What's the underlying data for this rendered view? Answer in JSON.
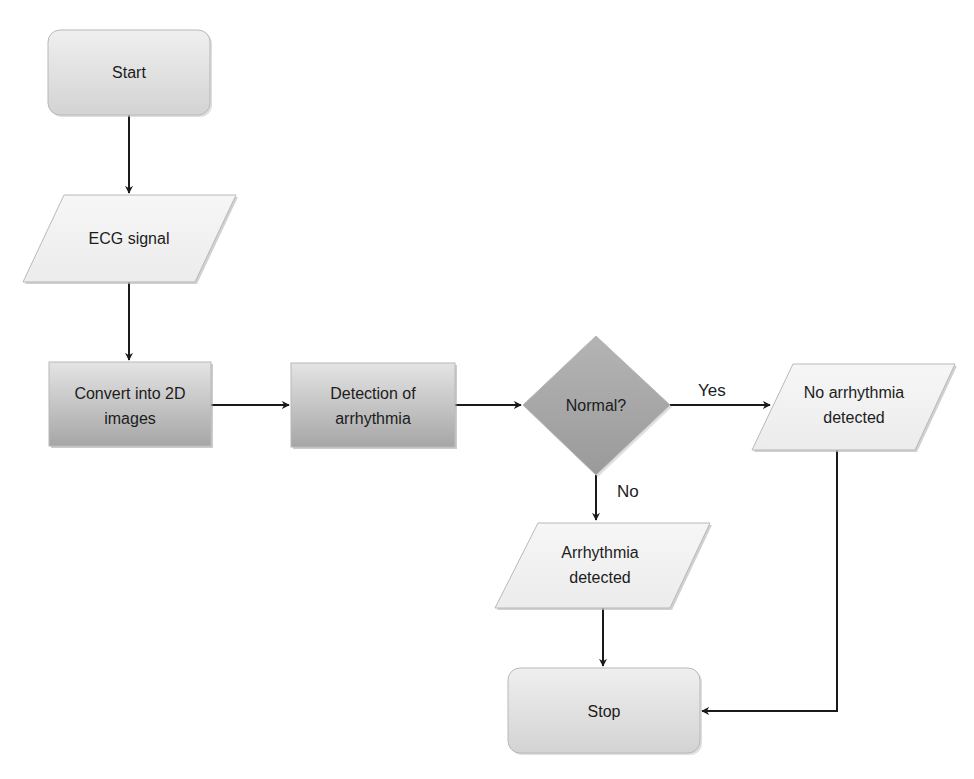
{
  "diagram": {
    "type": "flowchart",
    "colors": {
      "terminal_fill_top": "#eeeeee",
      "terminal_fill_bottom": "#d6d6d6",
      "io_fill": "#f2f2f2",
      "process_fill_top": "#e2e2e2",
      "process_fill_bottom": "#a9a9a9",
      "decision_fill": "#a8a8a8",
      "edge": "#1a1a1a",
      "text": "#1c1c1c"
    },
    "nodes": {
      "start": {
        "shape": "terminal",
        "lines": [
          "Start"
        ]
      },
      "ecg": {
        "shape": "input-output",
        "lines": [
          "ECG signal"
        ]
      },
      "convert": {
        "shape": "process",
        "lines": [
          "Convert into 2D",
          "images"
        ]
      },
      "detection": {
        "shape": "process",
        "lines": [
          "Detection of",
          "arrhythmia"
        ]
      },
      "decision": {
        "shape": "decision",
        "lines": [
          "Normal?"
        ]
      },
      "no_arr": {
        "shape": "input-output",
        "lines": [
          "No arrhythmia",
          "detected"
        ]
      },
      "arr": {
        "shape": "input-output",
        "lines": [
          "Arrhythmia",
          "detected"
        ]
      },
      "stop": {
        "shape": "terminal",
        "lines": [
          "Stop"
        ]
      }
    },
    "edges": {
      "yes_label": "Yes",
      "no_label": "No",
      "list": [
        {
          "from": "Start",
          "to": "ECG signal"
        },
        {
          "from": "ECG signal",
          "to": "Convert into 2D images"
        },
        {
          "from": "Convert into 2D images",
          "to": "Detection of arrhythmia"
        },
        {
          "from": "Detection of arrhythmia",
          "to": "Normal?"
        },
        {
          "from": "Normal?",
          "to": "No arrhythmia detected",
          "label": "Yes"
        },
        {
          "from": "Normal?",
          "to": "Arrhythmia detected",
          "label": "No"
        },
        {
          "from": "Arrhythmia detected",
          "to": "Stop"
        },
        {
          "from": "No arrhythmia detected",
          "to": "Stop"
        }
      ]
    }
  }
}
